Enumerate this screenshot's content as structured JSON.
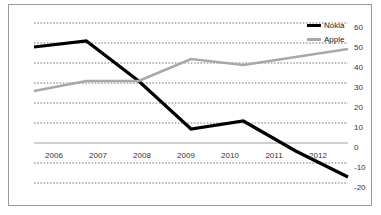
{
  "chart_data": {
    "type": "line",
    "title": "",
    "subtitle": "",
    "xlabel": "",
    "ylabel": "",
    "categories": [
      "2006",
      "2007",
      "2008",
      "2009",
      "2010",
      "2011",
      "2012"
    ],
    "x": [
      2006,
      2007,
      2008,
      2009,
      2010,
      2011,
      2012
    ],
    "series": [
      {
        "name": "Nokia",
        "color": "#000000",
        "values": [
          48,
          51,
          31,
          7,
          11,
          -4,
          -17
        ]
      },
      {
        "name": "Apple",
        "color": "#a8a8a8",
        "values": [
          26,
          31,
          31,
          42,
          39,
          43,
          47
        ]
      }
    ],
    "ylim": [
      -20,
      60
    ],
    "yticks": [
      60,
      50,
      40,
      30,
      20,
      10,
      0,
      -10,
      -20
    ],
    "ytick_labels": [
      "60",
      "50",
      "40",
      "30",
      "20",
      "10",
      "0",
      "-10",
      "-20"
    ],
    "grid": true,
    "grid_style": "dotted",
    "grid_color": "#555555",
    "legend_position": "top-right",
    "axis_line_value": 0,
    "axis_line_color": "#a0a0a0",
    "frame_color": "#9a9a9a",
    "background": "#ffffff"
  },
  "legend": {
    "entries": [
      {
        "label": "Nokia"
      },
      {
        "label": "Apple"
      }
    ]
  },
  "axes": {
    "y_labels": [
      "60",
      "50",
      "40",
      "30",
      "20",
      "10",
      "0",
      "-10",
      "-20"
    ],
    "x_labels": [
      "2006",
      "2007",
      "2008",
      "2009",
      "2010",
      "2011",
      "2012"
    ]
  }
}
